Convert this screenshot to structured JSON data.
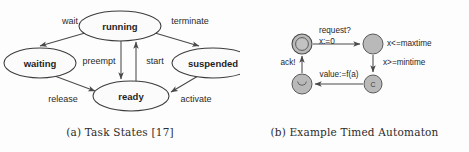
{
  "figure": {
    "background_color": "#fdfdfd",
    "node_fill": "#fbfbfb",
    "node_stroke": "#3a3a3a",
    "edge_color": "#4a4a4a",
    "ta_node_fill": "#b9b9b9",
    "text_color": "#1f1f1f"
  },
  "panel_a": {
    "caption": "(a) Task States [17]",
    "nodes": [
      {
        "id": "running",
        "label": "running",
        "cx": 120,
        "cy": 26,
        "rx": 41,
        "ry": 15
      },
      {
        "id": "waiting",
        "label": "waiting",
        "cx": 40,
        "cy": 63,
        "rx": 36,
        "ry": 15
      },
      {
        "id": "suspended",
        "label": "suspended",
        "cx": 213,
        "cy": 63,
        "rx": 41,
        "ry": 15
      },
      {
        "id": "ready",
        "label": "ready",
        "cx": 131,
        "cy": 96,
        "rx": 38,
        "ry": 15
      }
    ],
    "edges": [
      {
        "id": "wait",
        "label": "wait",
        "from": "running",
        "to": "waiting",
        "label_x": 70,
        "label_y": 22
      },
      {
        "id": "terminate",
        "label": "terminate",
        "from": "running",
        "to": "suspended",
        "label_x": 190,
        "label_y": 22
      },
      {
        "id": "preempt",
        "label": "preempt",
        "from": "running",
        "to": "ready",
        "label_x": 103,
        "label_y": 62
      },
      {
        "id": "start",
        "label": "start",
        "from": "ready",
        "to": "running",
        "label_x": 152,
        "label_y": 62
      },
      {
        "id": "release",
        "label": "release",
        "from": "waiting",
        "to": "ready",
        "label_x": 63,
        "label_y": 100
      },
      {
        "id": "activate",
        "label": "activate",
        "from": "suspended",
        "to": "ready",
        "label_x": 196,
        "label_y": 100
      }
    ]
  },
  "panel_b": {
    "caption": "(b) Example Timed Automaton",
    "nodes": [
      {
        "id": "initial",
        "glyph": "",
        "cx": 62,
        "cy": 44,
        "r": 10,
        "double": true
      },
      {
        "id": "waitmax",
        "glyph": "",
        "cx": 133,
        "cy": 44,
        "r": 10,
        "double": false
      },
      {
        "id": "commit",
        "glyph": "C",
        "cx": 133,
        "cy": 84,
        "r": 9,
        "double": false
      },
      {
        "id": "done",
        "glyph": "U",
        "cx": 62,
        "cy": 84,
        "r": 10,
        "double": false
      }
    ],
    "edges": [
      {
        "id": "request-edge",
        "from": "initial",
        "to": "waitmax",
        "labels": [
          "request?",
          "x:=0"
        ],
        "label_x": 76,
        "label_y": 30
      },
      {
        "id": "mintime-edge",
        "from": "waitmax",
        "to": "commit",
        "labels": [
          "x>=mintime"
        ],
        "label_x": 142,
        "label_y": 64
      },
      {
        "id": "value-edge",
        "from": "commit",
        "to": "done",
        "labels": [
          "value:=f(a)"
        ],
        "label_x": 97,
        "label_y": 76
      },
      {
        "id": "ack-edge",
        "from": "done",
        "to": "initial",
        "labels": [
          "ack!"
        ],
        "label_x": 48,
        "label_y": 64
      }
    ],
    "invariants": [
      {
        "id": "maxtime-invariant",
        "text": "x<=maxtime",
        "x": 148,
        "y": 44
      }
    ]
  }
}
